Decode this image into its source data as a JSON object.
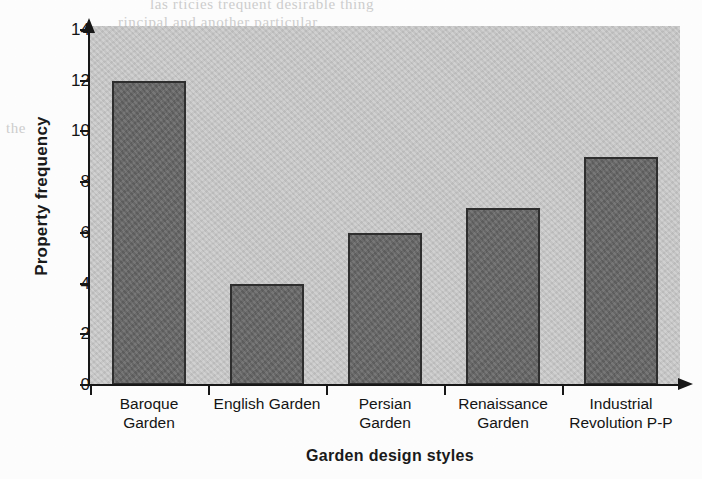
{
  "chart_data": {
    "type": "bar",
    "title": "",
    "xlabel": "Garden  design styles",
    "ylabel": "Property frequency",
    "categories": [
      "Baroque Garden",
      "English Garden",
      "Persian Garden",
      "Renaissance Garden",
      "Industrial Revolution P-P"
    ],
    "category_lines": [
      [
        "Baroque",
        "Garden"
      ],
      [
        "English Garden",
        ""
      ],
      [
        "Persian",
        "Garden"
      ],
      [
        "Renaissance",
        "Garden"
      ],
      [
        "Industrial",
        "Revolution P-P"
      ]
    ],
    "values": [
      12,
      4,
      6,
      7,
      9
    ],
    "ylim": [
      0,
      14
    ],
    "ytick_labels": [
      "14",
      "12",
      "10",
      "8",
      "6",
      "4",
      "2",
      "0"
    ],
    "ytick_values": [
      14,
      12,
      10,
      8,
      6,
      4,
      2,
      0
    ],
    "grid": false,
    "legend": false,
    "bar_color": "#6b6b6b",
    "bar_edge_color": "#2e2e2e",
    "plot_background_color": "#c9c9c9",
    "axis_color": "#171717",
    "page_background_color": "#ffffff"
  },
  "scan_artifacts": {
    "bleed_top": "las rticies trequent desirable thing",
    "bleed_top2": "rincipal and another particular",
    "bleed_left": "the",
    "bleed_mid": "coming",
    "bleed_right": "within"
  }
}
